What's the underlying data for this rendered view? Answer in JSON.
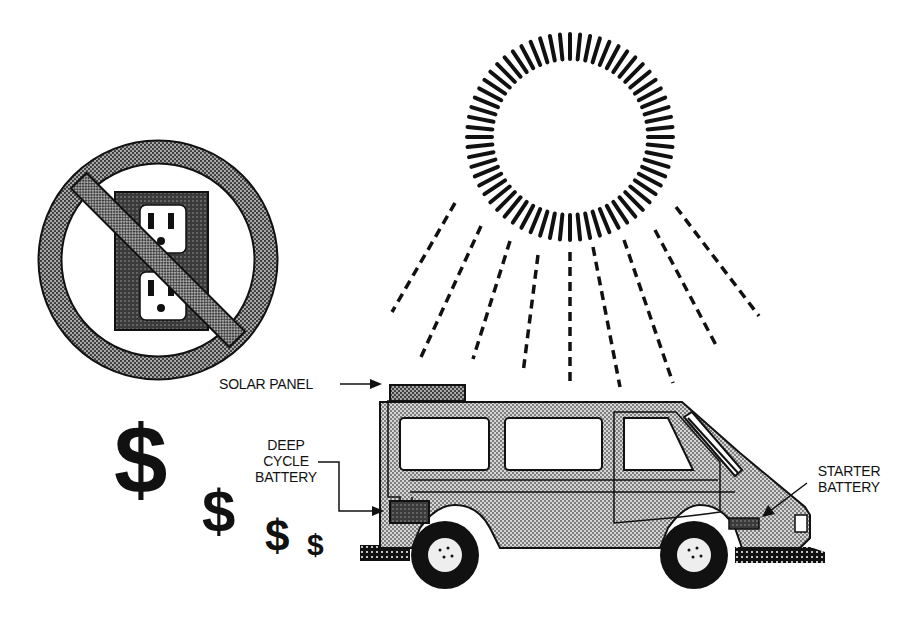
{
  "diagram": {
    "labels": {
      "solar_panel": "SOLAR PANEL",
      "deep_cycle_battery_line1": "DEEP",
      "deep_cycle_battery_line2": "CYCLE",
      "deep_cycle_battery_line3": "BATTERY",
      "starter_battery_line1": "STARTER",
      "starter_battery_line2": "BATTERY"
    },
    "symbols": {
      "dollar_signs": [
        "$",
        "$",
        "$",
        "$"
      ],
      "no_outlet_icon": "prohibition sign over electrical wall outlet",
      "sun_icon": "sun with radiating dashed rays",
      "van_icon": "camper van with roof solar panel"
    },
    "colors": {
      "ink": "#111111",
      "halftone_light": "#bdbdbd",
      "halftone_mid": "#8a8a8a",
      "halftone_dark": "#4a4a4a",
      "background": "#ffffff"
    }
  }
}
